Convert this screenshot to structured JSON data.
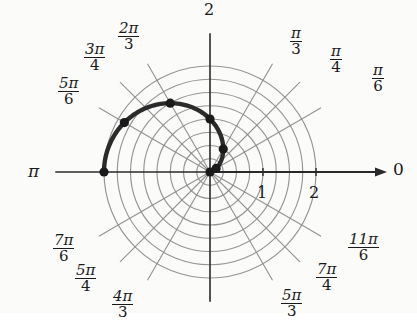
{
  "figure": {
    "kind": "polar-coordinate-grid-with-curve",
    "background_color": "#fbfbfa",
    "grid_color": "#8c8c8c",
    "axis_color": "#2a2a2a",
    "curve_color": "#2b2b2b",
    "point_color": "#1a1a1a"
  },
  "axis_labels": {
    "right_zero": "0",
    "left_pi": "π",
    "top_two": "2",
    "radial_tick_one": "1",
    "radial_tick_two": "2"
  },
  "angle_labels": [
    {
      "id": "pi-over-6",
      "numerator": "π",
      "denominator": "6",
      "angle_deg": 30,
      "x": 372,
      "y": 63
    },
    {
      "id": "pi-over-4",
      "numerator": "π",
      "denominator": "4",
      "angle_deg": 45,
      "x": 330,
      "y": 44
    },
    {
      "id": "pi-over-3",
      "numerator": "π",
      "denominator": "3",
      "angle_deg": 60,
      "x": 290,
      "y": 26
    },
    {
      "id": "2pi-over-3",
      "numerator": "2π",
      "denominator": "3",
      "angle_deg": 120,
      "x": 118,
      "y": 21
    },
    {
      "id": "3pi-over-4",
      "numerator": "3π",
      "denominator": "4",
      "angle_deg": 135,
      "x": 84,
      "y": 42
    },
    {
      "id": "5pi-over-6",
      "numerator": "5π",
      "denominator": "6",
      "angle_deg": 150,
      "x": 58,
      "y": 76
    },
    {
      "id": "7pi-over-6",
      "numerator": "7π",
      "denominator": "6",
      "angle_deg": 210,
      "x": 53,
      "y": 233
    },
    {
      "id": "5pi-over-4",
      "numerator": "5π",
      "denominator": "4",
      "angle_deg": 225,
      "x": 75,
      "y": 263
    },
    {
      "id": "4pi-over-3",
      "numerator": "4π",
      "denominator": "3",
      "angle_deg": 240,
      "x": 112,
      "y": 289
    },
    {
      "id": "5pi-over-3",
      "numerator": "5π",
      "denominator": "3",
      "angle_deg": 300,
      "x": 281,
      "y": 288
    },
    {
      "id": "7pi-over-4",
      "numerator": "7π",
      "denominator": "4",
      "angle_deg": 315,
      "x": 316,
      "y": 262
    },
    {
      "id": "11pi-over-6",
      "numerator": "11π",
      "denominator": "6",
      "angle_deg": 330,
      "x": 348,
      "y": 232
    }
  ],
  "chart_data": {
    "type": "line",
    "coordinate_system": "polar",
    "title": "",
    "xlabel": "",
    "ylabel": "",
    "grid": true,
    "radial_axis": {
      "label_ticks": [
        1,
        2
      ],
      "range": [
        0,
        2
      ],
      "circle_step": 0.25,
      "circle_count": 8
    },
    "angular_axis": {
      "unit": "radians",
      "ray_count": 12,
      "ray_step_deg": 30,
      "labeled_rays": [
        "0",
        "π/6",
        "π/4",
        "π/3",
        "π",
        "2π/3",
        "3π/4",
        "5π/6",
        "7π/6",
        "5π/4",
        "4π/3",
        "5π/3",
        "7π/4",
        "11π/6"
      ]
    },
    "series": [
      {
        "name": "r = 1 - cos(theta)",
        "equation": "r = 1 − cos θ",
        "theta_min_deg": 0,
        "theta_max_deg": 180,
        "theta_deg": [
          0,
          15,
          30,
          45,
          60,
          75,
          90,
          105,
          120,
          135,
          150,
          165,
          180
        ],
        "r": [
          0.0,
          0.034,
          0.134,
          0.293,
          0.5,
          0.741,
          1.0,
          1.259,
          1.5,
          1.707,
          1.866,
          1.966,
          2.0
        ],
        "marked_points": [
          {
            "theta_deg": 0,
            "theta_label": "0",
            "r": 0.0
          },
          {
            "theta_deg": 30,
            "theta_label": "π/6",
            "r": 0.134
          },
          {
            "theta_deg": 60,
            "theta_label": "π/3",
            "r": 0.5
          },
          {
            "theta_deg": 90,
            "theta_label": "π/2",
            "r": 1.0
          },
          {
            "theta_deg": 120,
            "theta_label": "2π/3",
            "r": 1.5
          },
          {
            "theta_deg": 150,
            "theta_label": "5π/6",
            "r": 1.866
          },
          {
            "theta_deg": 180,
            "theta_label": "π",
            "r": 2.0
          }
        ]
      }
    ]
  }
}
